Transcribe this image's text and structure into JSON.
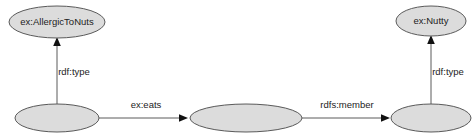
{
  "diagram": {
    "type": "rdf-graph",
    "background_color": "#ffffff",
    "node_fill_color": "#dcdcdc",
    "node_stroke_color": "#5a5a5a",
    "edge_color": "#5a5a5a",
    "arrowhead_color": "#111111",
    "text_color": "#1c1c1c",
    "nodes": [
      {
        "id": "class-allergic-to-nuts",
        "label": "ex:AllergicToNuts",
        "kind": "resource",
        "cx": 57,
        "cy": 22,
        "rx": 48,
        "ry": 16
      },
      {
        "id": "class-nutty",
        "label": "ex:Nutty",
        "kind": "resource",
        "cx": 431,
        "cy": 21,
        "rx": 35,
        "ry": 15
      },
      {
        "id": "blank-node-1",
        "label": "",
        "kind": "blank",
        "cx": 57,
        "cy": 118,
        "rx": 42,
        "ry": 14
      },
      {
        "id": "blank-node-2",
        "label": "",
        "kind": "blank",
        "cx": 246,
        "cy": 118,
        "rx": 56,
        "ry": 14
      },
      {
        "id": "blank-node-3",
        "label": "",
        "kind": "blank",
        "cx": 431,
        "cy": 118,
        "rx": 40,
        "ry": 14
      }
    ],
    "edges": [
      {
        "id": "edge-rdf-type-left",
        "label": "rdf:type",
        "from": "blank-node-1",
        "to": "class-allergic-to-nuts",
        "orientation": "vertical",
        "x1": 57,
        "y1": 104,
        "x2": 57,
        "y2": 42,
        "label_x": 74,
        "label_y": 72
      },
      {
        "id": "edge-ex-eats",
        "label": "ex:eats",
        "from": "blank-node-1",
        "to": "blank-node-2",
        "orientation": "horizontal",
        "x1": 99,
        "y1": 118,
        "x2": 186,
        "y2": 118,
        "label_x": 146,
        "label_y": 105
      },
      {
        "id": "edge-rdfs-member",
        "label": "rdfs:member",
        "from": "blank-node-2",
        "to": "blank-node-3",
        "orientation": "horizontal",
        "x1": 302,
        "y1": 118,
        "x2": 387,
        "y2": 118,
        "label_x": 347,
        "label_y": 105
      },
      {
        "id": "edge-rdf-type-right",
        "label": "rdf:type",
        "from": "blank-node-3",
        "to": "class-nutty",
        "orientation": "vertical",
        "x1": 431,
        "y1": 104,
        "x2": 431,
        "y2": 40,
        "label_x": 448,
        "label_y": 72
      }
    ]
  }
}
